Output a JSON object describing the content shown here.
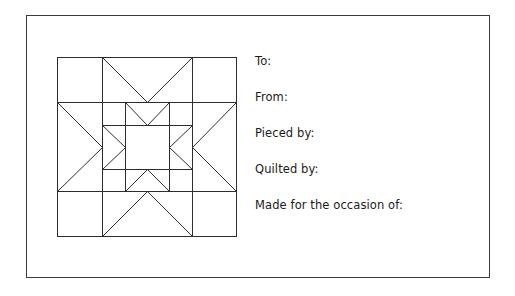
{
  "card": {
    "border_color": "#3b3b3b",
    "background_color": "#ffffff"
  },
  "quilt_block": {
    "name": "star-within-a-star-quilt-block",
    "stroke_color": "#2d2d2d",
    "description": "Nested sawtooth star quilt block line drawing",
    "outer_block": {
      "size": 180,
      "corner_unit": 45,
      "center_unit": 90
    },
    "inner_star": {
      "size": 90,
      "corner_unit": 22.5,
      "center_unit": 45
    }
  },
  "fields": [
    {
      "label": "To:"
    },
    {
      "label": "From:"
    },
    {
      "label": "Pieced by:"
    },
    {
      "label": "Quilted by:"
    },
    {
      "label": "Made for the occasion of:"
    }
  ]
}
